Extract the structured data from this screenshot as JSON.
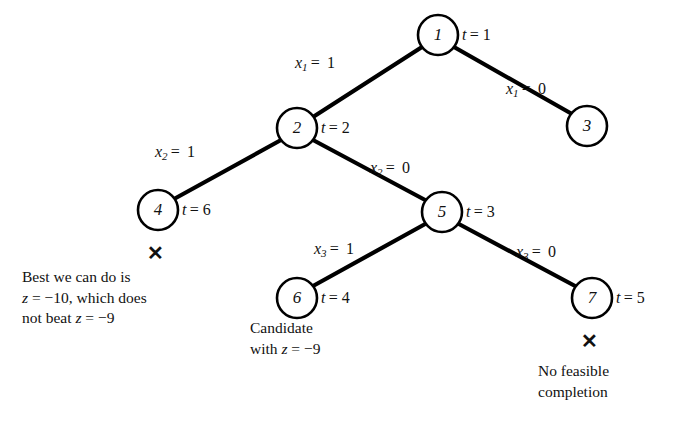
{
  "figure": {
    "type": "branch-and-bound-tree",
    "background_color": "#ffffff",
    "ink_color": "#000000"
  },
  "nodes": [
    {
      "id": "1",
      "label": "1",
      "cx": 438,
      "cy": 35,
      "r": 20,
      "t_label": "t = 1",
      "t_x": 462,
      "t_y": 26,
      "marked_infeasible": false
    },
    {
      "id": "2",
      "label": "2",
      "cx": 297,
      "cy": 128,
      "r": 20,
      "t_label": "t = 2",
      "t_x": 321,
      "t_y": 119,
      "marked_infeasible": false
    },
    {
      "id": "3",
      "label": "3",
      "cx": 587,
      "cy": 126,
      "r": 20,
      "t_label": "",
      "t_x": 0,
      "t_y": 0,
      "marked_infeasible": false
    },
    {
      "id": "4",
      "label": "4",
      "cx": 158,
      "cy": 210,
      "r": 20,
      "t_label": "t = 6",
      "t_x": 182,
      "t_y": 201,
      "marked_infeasible": true
    },
    {
      "id": "5",
      "label": "5",
      "cx": 442,
      "cy": 212,
      "r": 20,
      "t_label": "t = 3",
      "t_x": 466,
      "t_y": 203,
      "marked_infeasible": false
    },
    {
      "id": "6",
      "label": "6",
      "cx": 297,
      "cy": 298,
      "r": 20,
      "t_label": "t = 4",
      "t_x": 321,
      "t_y": 289,
      "marked_infeasible": false
    },
    {
      "id": "7",
      "label": "7",
      "cx": 592,
      "cy": 298,
      "r": 20,
      "t_label": "t = 5",
      "t_x": 616,
      "t_y": 289,
      "marked_infeasible": true
    }
  ],
  "edges": [
    {
      "from": "1",
      "to": "2",
      "x1": 422,
      "y1": 47,
      "x2": 313,
      "y2": 117,
      "label_var": "x",
      "label_sub": "1",
      "label_val": "1",
      "label_x": 295,
      "label_y": 54
    },
    {
      "from": "1",
      "to": "3",
      "x1": 454,
      "y1": 47,
      "x2": 572,
      "y2": 114,
      "label_var": "x",
      "label_sub": "1",
      "label_val": "0",
      "label_x": 506,
      "label_y": 80
    },
    {
      "from": "2",
      "to": "4",
      "x1": 281,
      "y1": 140,
      "x2": 174,
      "y2": 199,
      "label_var": "x",
      "label_sub": "2",
      "label_val": "1",
      "label_x": 155,
      "label_y": 143
    },
    {
      "from": "2",
      "to": "5",
      "x1": 313,
      "y1": 140,
      "x2": 427,
      "y2": 201,
      "label_var": "x",
      "label_sub": "2",
      "label_val": "0",
      "label_x": 370,
      "label_y": 159
    },
    {
      "from": "5",
      "to": "6",
      "x1": 427,
      "y1": 223,
      "x2": 313,
      "y2": 286,
      "label_var": "x",
      "label_sub": "3",
      "label_val": "1",
      "label_x": 314,
      "label_y": 240
    },
    {
      "from": "5",
      "to": "7",
      "x1": 457,
      "y1": 223,
      "x2": 577,
      "y2": 287,
      "label_var": "x",
      "label_sub": "3",
      "label_val": "0",
      "label_x": 516,
      "label_y": 243
    }
  ],
  "x_marks": [
    {
      "for_node": "4",
      "glyph": "✕",
      "x": 147,
      "y": 243
    },
    {
      "for_node": "7",
      "glyph": "✕",
      "x": 581,
      "y": 331
    }
  ],
  "annotations": [
    {
      "id": "node-4-note",
      "x": 22,
      "y": 267,
      "lines": [
        {
          "parts": [
            {
              "text": "Best we can do is",
              "italic": false
            }
          ]
        },
        {
          "parts": [
            {
              "text": "z",
              "italic": true
            },
            {
              "text": " =  −10, which does",
              "italic": false
            }
          ]
        },
        {
          "parts": [
            {
              "text": "not beat ",
              "italic": false
            },
            {
              "text": "z",
              "italic": true
            },
            {
              "text": " =  −9",
              "italic": false
            }
          ]
        }
      ],
      "plain": "Best we can do is\nz =  −10, which does\nnot beat z =  −9"
    },
    {
      "id": "node-6-note",
      "x": 250,
      "y": 318,
      "lines": [
        {
          "parts": [
            {
              "text": "Candidate",
              "italic": false
            }
          ]
        },
        {
          "parts": [
            {
              "text": "with ",
              "italic": false
            },
            {
              "text": "z",
              "italic": true
            },
            {
              "text": " =  −9",
              "italic": false
            }
          ]
        }
      ],
      "plain": "Candidate\nwith z =  −9"
    },
    {
      "id": "node-7-note",
      "x": 538,
      "y": 361,
      "lines": [
        {
          "parts": [
            {
              "text": "No feasible",
              "italic": false
            }
          ]
        },
        {
          "parts": [
            {
              "text": "completion",
              "italic": false
            }
          ]
        }
      ],
      "plain": "No feasible\ncompletion"
    }
  ]
}
